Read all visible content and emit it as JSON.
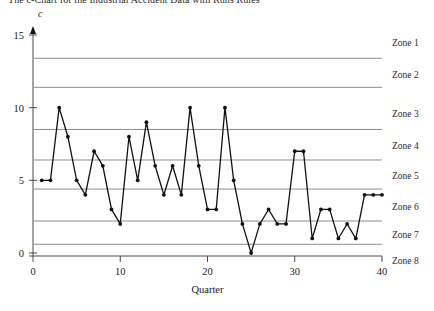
{
  "title": "The c-Chart for the Industrial Accident Data with Runs Rules",
  "chart_data": {
    "type": "line",
    "title": "The c-Chart for the Industrial Accident Data with Runs Rules",
    "xlabel": "Quarter",
    "ylabel": "c",
    "xlim": [
      0,
      40
    ],
    "ylim": [
      0,
      16
    ],
    "xticks": [
      0,
      10,
      20,
      30,
      40
    ],
    "yticks": [
      0,
      5,
      10,
      15
    ],
    "grid": false,
    "legend_position": "right",
    "series": [
      {
        "name": "c",
        "x": [
          1,
          2,
          3,
          4,
          5,
          6,
          7,
          8,
          9,
          10,
          11,
          12,
          13,
          14,
          15,
          16,
          17,
          18,
          19,
          20,
          21,
          22,
          23,
          24,
          25,
          26,
          27,
          28,
          29,
          30,
          31,
          32,
          33,
          34,
          35,
          36,
          37,
          38,
          39,
          40
        ],
        "values": [
          5,
          5,
          10,
          8,
          5,
          4,
          7,
          6,
          3,
          2,
          8,
          5,
          9,
          6,
          4,
          6,
          4,
          10,
          6,
          3,
          3,
          10,
          5,
          2,
          0,
          2,
          3,
          2,
          2,
          7,
          7,
          1,
          3,
          3,
          1,
          2,
          1,
          4,
          4,
          4
        ]
      }
    ],
    "zone_lines": [
      {
        "label": "Zone 1/2 boundary",
        "value": 13.4
      },
      {
        "label": "Zone 2/3 boundary",
        "value": 11.4
      },
      {
        "label": "Zone 3/4 boundary",
        "value": 8.5
      },
      {
        "label": "Zone 4/5 boundary",
        "value": 6.4
      },
      {
        "label": "Zone 5/6 boundary",
        "value": 4.4
      },
      {
        "label": "Zone 6/7 boundary",
        "value": 2.2
      },
      {
        "label": "Zone 7/8 boundary",
        "value": 0.6
      }
    ],
    "zone_labels": [
      {
        "text": "Zone 1",
        "y": 14.5
      },
      {
        "text": "Zone 2",
        "y": 12.3
      },
      {
        "text": "Zone 3",
        "y": 9.6
      },
      {
        "text": "Zone 4",
        "y": 7.4
      },
      {
        "text": "Zone 5",
        "y": 5.4
      },
      {
        "text": "Zone 6",
        "y": 3.2
      },
      {
        "text": "Zone 7",
        "y": 1.3
      },
      {
        "text": "Zone 8",
        "y": -0.5
      }
    ]
  }
}
